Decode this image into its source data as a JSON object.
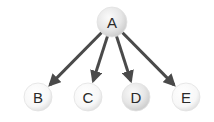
{
  "diagram": {
    "type": "tree",
    "edge_color": "#4a4a4a",
    "nodes": [
      {
        "id": "A",
        "label": "A",
        "x": 112,
        "y": 22,
        "r": 15,
        "shade": "gray"
      },
      {
        "id": "B",
        "label": "B",
        "x": 38,
        "y": 97,
        "r": 14,
        "shade": "white"
      },
      {
        "id": "C",
        "label": "C",
        "x": 88,
        "y": 97,
        "r": 14,
        "shade": "white"
      },
      {
        "id": "D",
        "label": "D",
        "x": 136,
        "y": 97,
        "r": 14,
        "shade": "gray"
      },
      {
        "id": "E",
        "label": "E",
        "x": 186,
        "y": 97,
        "r": 14,
        "shade": "white"
      }
    ],
    "edges": [
      {
        "from": "A",
        "to": "B"
      },
      {
        "from": "A",
        "to": "C"
      },
      {
        "from": "A",
        "to": "D"
      },
      {
        "from": "A",
        "to": "E"
      }
    ]
  }
}
